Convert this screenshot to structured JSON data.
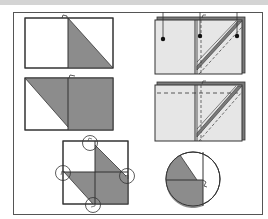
{
  "figure": {
    "panels": [
      {
        "id": 1,
        "label": "fold-step-1",
        "shape": "rectangle with half shaded triangle"
      },
      {
        "id": 2,
        "label": "fold-step-2",
        "shape": "rectangle folded over with shaded triangle and half"
      },
      {
        "id": 3,
        "label": "fold-step-3",
        "shape": "layered paper with three pins and diagonal strip"
      },
      {
        "id": 4,
        "label": "fold-step-4",
        "shape": "layered paper with dashed fold lines and diagonal strip"
      },
      {
        "id": 5,
        "label": "fold-step-5",
        "shape": "square with four circled pivot points and shaded parallelogram"
      },
      {
        "id": 6,
        "label": "fold-step-6",
        "shape": "circle with shaded sector"
      }
    ]
  },
  "colors": {
    "background": "#ffffff",
    "line": "#333333",
    "shade": "#8c8c8c",
    "paper": "#e6e6e6",
    "back_layer": "#7a7a7a",
    "top_strip": "#d4d4d4"
  }
}
